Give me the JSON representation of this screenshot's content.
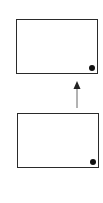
{
  "diagram": {
    "nodes": [
      {
        "id": "top-box",
        "label": "",
        "marker": "dot-bottom-right"
      },
      {
        "id": "bottom-box",
        "label": "",
        "marker": "dot-bottom-right"
      }
    ],
    "edges": [
      {
        "from": "bottom-box",
        "to": "top-box",
        "style": "arrow",
        "direction": "up"
      }
    ],
    "colors": {
      "stroke": "#2a2a2a",
      "dot": "#111111",
      "arrow": "#555555",
      "background": "#ffffff"
    }
  }
}
